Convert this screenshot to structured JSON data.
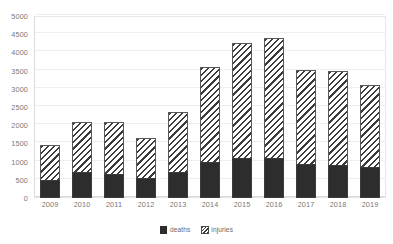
{
  "chart_data": {
    "type": "bar",
    "subtype": "stacked-bar",
    "title": "",
    "subtitle": "",
    "xlabel": "",
    "ylabel": "",
    "categories": [
      "2009",
      "2010",
      "2011",
      "2012",
      "2013",
      "2014",
      "2015",
      "2016",
      "2017",
      "2018",
      "2019"
    ],
    "series": [
      {
        "name": "deaths",
        "color": "#1c1c1c",
        "fill": "solid",
        "values": [
          500,
          720,
          670,
          550,
          720,
          1000,
          1100,
          1110,
          930,
          900,
          850
        ]
      },
      {
        "name": "injuries",
        "color": "#2b2b2b",
        "fill": "diagonal-hatch",
        "values": [
          950,
          1380,
          1430,
          1100,
          1630,
          2600,
          3150,
          3290,
          2590,
          2580,
          2250
        ]
      }
    ],
    "totals": [
      1450,
      2100,
      2100,
      1650,
      2350,
      3600,
      4250,
      4400,
      3520,
      3480,
      3100
    ],
    "ylim": [
      0,
      5000
    ],
    "ytick_values": [
      0,
      500,
      1000,
      1500,
      2000,
      2500,
      3000,
      3500,
      4000,
      4500,
      5000
    ],
    "ytick_labels": [
      "0",
      "500",
      "1000",
      "1500",
      "2000",
      "2500",
      "3000",
      "3500",
      "4000",
      "4500",
      "5000"
    ],
    "grid": true,
    "grid_axis": "y",
    "legend_position": "bottom",
    "legend_entries": [
      "deaths",
      "injuries"
    ]
  }
}
